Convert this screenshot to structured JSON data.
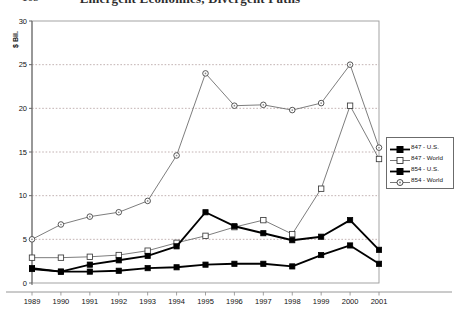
{
  "title": "Emergent Economies, Divergent Paths",
  "page_number": "168",
  "axis": {
    "y_label": "$ Bil.",
    "y_ticks": [
      0,
      5,
      10,
      15,
      20,
      25,
      30
    ],
    "y_min": 0,
    "y_max": 30,
    "x_ticks": [
      "1989",
      "1990",
      "1991",
      "1992",
      "1993",
      "1994",
      "1995",
      "1996",
      "1997",
      "1998",
      "1999",
      "2000",
      "2001"
    ]
  },
  "legend": {
    "position": "right",
    "items": [
      {
        "label": "847 - U.S.",
        "marker": "filled-square",
        "line": "thick",
        "color": "#000000"
      },
      {
        "label": "847 - World",
        "marker": "open-square",
        "line": "thin",
        "color": "#555555"
      },
      {
        "label": "854 - U.S.",
        "marker": "filled-square",
        "line": "thick",
        "color": "#000000"
      },
      {
        "label": "854 - World",
        "marker": "open-circle",
        "line": "thin",
        "color": "#555555"
      }
    ]
  },
  "chart_data": {
    "type": "line",
    "title": "Emergent Economies, Divergent Paths",
    "xlabel": "",
    "ylabel": "$ Bil.",
    "ylim": [
      0,
      30
    ],
    "grid": true,
    "legend_position": "right",
    "x": [
      "1989",
      "1990",
      "1991",
      "1992",
      "1993",
      "1994",
      "1995",
      "1996",
      "1997",
      "1998",
      "1999",
      "2000",
      "2001"
    ],
    "series": [
      {
        "name": "847 - U.S.",
        "marker": "filled-square",
        "values": [
          1.6,
          1.3,
          1.3,
          1.4,
          1.7,
          1.8,
          2.1,
          2.2,
          2.2,
          1.9,
          3.2,
          4.3,
          2.2
        ]
      },
      {
        "name": "847 - World",
        "marker": "open-square",
        "values": [
          2.9,
          2.9,
          3.0,
          3.2,
          3.7,
          4.6,
          5.4,
          6.4,
          7.2,
          5.6,
          10.8,
          20.3,
          14.2
        ]
      },
      {
        "name": "854 - U.S.",
        "marker": "filled-square",
        "values": [
          1.7,
          1.3,
          2.1,
          2.6,
          3.1,
          4.2,
          8.1,
          6.5,
          5.7,
          4.9,
          5.3,
          7.2,
          3.8
        ]
      },
      {
        "name": "854 - World",
        "marker": "open-circle",
        "values": [
          5.0,
          6.7,
          7.6,
          8.1,
          9.4,
          14.6,
          24.0,
          20.3,
          20.4,
          19.8,
          20.6,
          25.0,
          15.5
        ]
      }
    ]
  }
}
